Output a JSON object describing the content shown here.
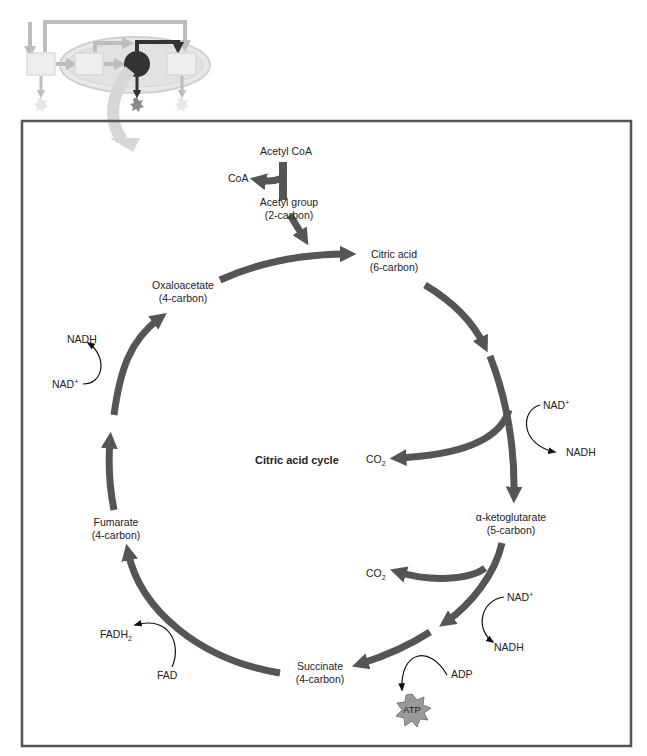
{
  "diagram": {
    "title": "Citric acid cycle",
    "colors": {
      "arrow": "#555555",
      "frame": "#555555",
      "cofactor_arrow": "#111111",
      "inset_light": "#d9d9d9",
      "inset_dark": "#333333",
      "atp_burst": "#9a9a9a"
    },
    "inset": {
      "description": "overview of cellular respiration with citric acid cycle highlighted"
    },
    "entry": {
      "acetyl_coa": "Acetyl CoA",
      "coa": "CoA",
      "acetyl_group": "Acetyl group",
      "acetyl_group_carbons": "(2-carbon)"
    },
    "intermediates": [
      {
        "name": "Citric acid",
        "carbons": "(6-carbon)"
      },
      {
        "name": "α-ketoglutarate",
        "carbons": "(5-carbon)"
      },
      {
        "name": "Succinate",
        "carbons": "(4-carbon)"
      },
      {
        "name": "Fumarate",
        "carbons": "(4-carbon)"
      },
      {
        "name": "Oxaloacetate",
        "carbons": "(4-carbon)"
      }
    ],
    "side_products": {
      "co2_1": {
        "base": "CO",
        "sub": "2"
      },
      "co2_2": {
        "base": "CO",
        "sub": "2"
      },
      "nad1_in": {
        "base": "NAD",
        "sup": "+"
      },
      "nad1_out": "NADH",
      "nad2_in": {
        "base": "NAD",
        "sup": "+"
      },
      "nad2_out": "NADH",
      "adp": "ADP",
      "atp": "ATP",
      "fad": "FAD",
      "fadh2": {
        "base": "FADH",
        "sub": "2"
      },
      "nad3_in": {
        "base": "NAD",
        "sup": "+"
      },
      "nad3_out": "NADH"
    }
  }
}
